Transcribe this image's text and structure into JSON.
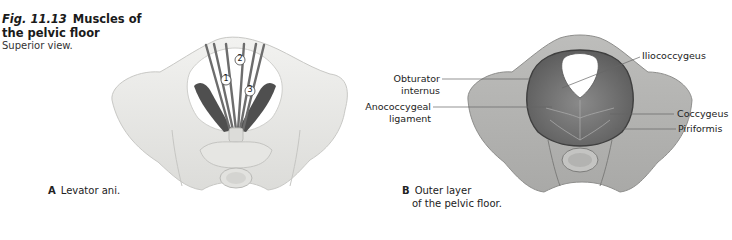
{
  "figure": {
    "number": "Fig. 11.13",
    "title": "Muscles of the pelvic floor",
    "subtitle": "Superior view."
  },
  "panels": [
    {
      "letter": "A",
      "caption": "Levator ani.",
      "callouts": [
        "1",
        "2",
        "3"
      ]
    },
    {
      "letter": "B",
      "caption_line1": "Outer layer",
      "caption_line2": "of the pelvic floor.",
      "labels": {
        "obturator_line1": "Obturator",
        "obturator_line2": "internus",
        "anococcygeal_line1": "Anococcygeal",
        "anococcygeal_line2": "ligament",
        "iliococcygeus": "Iliococcygeus",
        "coccygeus": "Coccygeus",
        "piriformis": "Piriformis"
      }
    }
  ],
  "colors": {
    "bone_light": "#ececea",
    "bone_shade": "#d6d6d3",
    "muscle_dark": "#555555",
    "muscle_mid": "#7a7a7a",
    "leader_line": "#666666"
  }
}
